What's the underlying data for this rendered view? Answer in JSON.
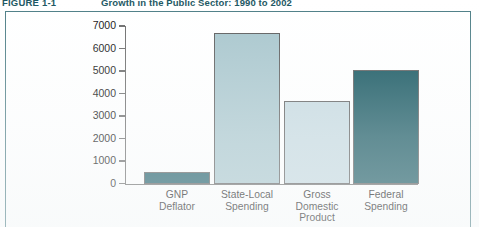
{
  "figure": {
    "number": "FIGURE 1-1",
    "title": "Growth in the Public Sector: 1990 to 2002"
  },
  "colors": {
    "frame_border": "#4d7e86",
    "axis": "#6b6b6b",
    "bar_dark_teal": "#1a5a66",
    "bar_light_teal": "#a8c6cd",
    "bar_pale_blue": "#c5d9e0",
    "bar_deep_teal": "#13545e",
    "text": "#111111",
    "caption_text": "#1d5863"
  },
  "chart_data": {
    "type": "bar",
    "title": "Growth in the Public Sector: 1990 to 2002",
    "xlabel": "",
    "ylabel": "",
    "ylim": [
      0,
      7000
    ],
    "yticks": [
      0,
      1000,
      2000,
      3000,
      4000,
      5000,
      6000,
      7000
    ],
    "ytick_labels": [
      "0",
      "1000",
      "2000",
      "3000",
      "4000",
      "5000",
      "6000",
      "7000"
    ],
    "grid": false,
    "legend": "none",
    "categories": [
      "GNP\nDeflator",
      "State-Local\nSpending",
      "Gross\nDomestic\nProduct",
      "Federal\nSpending"
    ],
    "values": [
      500,
      6700,
      3650,
      5050
    ],
    "bar_colors": [
      "#1a5a66",
      "#a8c6cd",
      "#c5d9e0",
      "#13545e"
    ]
  },
  "x_labels": [
    {
      "line1": "GNP",
      "line2": "Deflator",
      "line3": ""
    },
    {
      "line1": "State-Local",
      "line2": "Spending",
      "line3": ""
    },
    {
      "line1": "Gross",
      "line2": "Domestic",
      "line3": "Product"
    },
    {
      "line1": "Federal",
      "line2": "Spending",
      "line3": ""
    }
  ]
}
